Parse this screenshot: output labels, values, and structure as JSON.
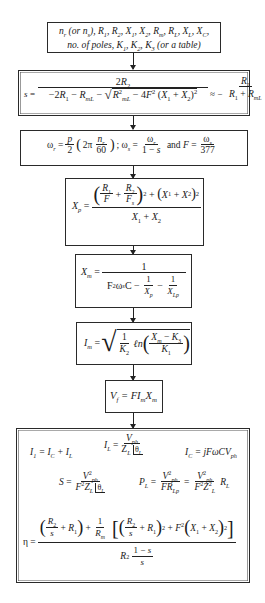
{
  "diagram": {
    "type": "flowchart",
    "direction": "top-to-bottom",
    "boxes": [
      {
        "id": "inputs",
        "line1": "n_r (or n_s), R_1, R_2, X_1, X_2, R_m, R_L, X_L, X_C,",
        "line2": "no. of poles, K_1, K_2, K_3 (or a table)",
        "text_line1": "(or",
        "text_line2": "no. of poles, K",
        "text_line2b": "(or a table)"
      },
      {
        "id": "slip",
        "equation": "s = 2R_2 / (-2R_1 - R_mL - sqrt(R_mL^2 - 4F^2 (X_1 + X_2)^2)) ≈ - R_2 / (R_1 + R_mL)",
        "lhs": "s =",
        "num": "2R",
        "approx": "≈ −",
        "minus2R1": "−2R",
        "minusRmL": "− R",
        "inner": "− 4F",
        "paren": "(X",
        "plus": "+ X",
        "rhs_num": "R",
        "rhs_den": "R",
        "rhs_den_plus": "+ R"
      },
      {
        "id": "frequencies",
        "equation": "ω_r = p/2 (2π n_r/60); ω_s = ω_r/(1−s) and F = ω_s/377",
        "omega_r": "ω",
        "p": "p",
        "two": "2",
        "two_pi": "2π",
        "n_r": "n",
        "sixty": "60",
        "semicolon": ";",
        "omega_s": "ω",
        "one_minus_s": "1 − s",
        "and": "and",
        "F": "F",
        "c377": "377"
      },
      {
        "id": "xp",
        "equation": "X_p = ((R_1/F + R_2/F_s)^2 + (X_1 + X_2)^2) / (X_1 + X_2)"
      },
      {
        "id": "xm",
        "equation": "X_m = 1 / (F^2 ω_s C − 1/X_p − 1/X_Lp)",
        "one": "1"
      },
      {
        "id": "im",
        "equation": "I_m = sqrt( (1/K_2) ln((X_m − K_3)/K_1) )",
        "ln": "ℓn"
      },
      {
        "id": "vf",
        "equation": "V_f = F I_m X_m"
      },
      {
        "id": "outputs",
        "equations": [
          "I_1 = I_C + I_L",
          "I_L = V_ph / (Z_L ∠θ_L)",
          "I_C = jFωCV_ph",
          "S = V_ph^2 / (F^2 Z_L ∠θ_L)",
          "P_L = V_ph^2 / (F R_Lp) = V_ph^2 / (F^2 Z_L^2) R_L",
          "η = ((R_2/s + R_1) + (1/R_m)[(R_2/s + R_1)^2 + F^2 (X_1 + X_2)^2]) / (R_2 (1−s)/s)"
        ],
        "eta": "η ="
      }
    ],
    "arrows": [
      {
        "from": "inputs",
        "to": "slip"
      },
      {
        "from": "slip",
        "to": "frequencies"
      },
      {
        "from": "frequencies",
        "to": "xp"
      },
      {
        "from": "xp",
        "to": "xm"
      },
      {
        "from": "xm",
        "to": "im"
      },
      {
        "from": "im",
        "to": "vf"
      },
      {
        "from": "vf",
        "to": "outputs"
      }
    ]
  }
}
